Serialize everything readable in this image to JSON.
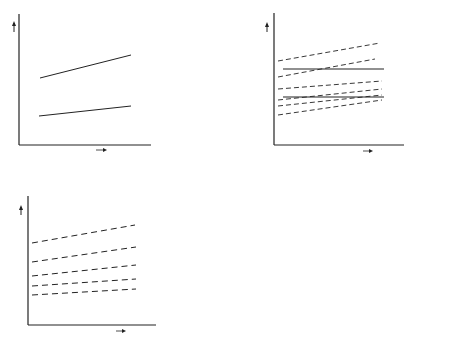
{
  "panels": {
    "a": {
      "caption": "a",
      "y_axis_label": "Z",
      "x_axis_label": "S",
      "lines": [
        {
          "label": "P",
          "subscript": "2",
          "style": "solid"
        },
        {
          "label": "P",
          "subscript": "1",
          "style": "solid"
        }
      ]
    },
    "b": {
      "caption": "b",
      "y_axis_label": "Z",
      "x_axis_label": "S",
      "dashed_label": "p",
      "solid_lines": [
        {
          "label": "Z",
          "subscript": "2"
        },
        {
          "label": "Z",
          "subscript": "1"
        }
      ]
    },
    "c": {
      "caption": "c",
      "y_axis_label": "Z",
      "x_axis_label": "S",
      "region_labels": {
        "warm": "Warm",
        "cold": "Cold"
      },
      "solid_lines": [
        {
          "label": "Z",
          "subscript": "2"
        },
        {
          "label": "Z",
          "subscript": "1"
        }
      ]
    },
    "d": {
      "caption": "d",
      "y_axis_label": "Z",
      "x_axis_label": "s",
      "point_a": "A",
      "point_b": "B",
      "interval_label": "δs",
      "level_label": "Z",
      "level_subscript": "s",
      "baseline_label": "Mean Sea Level",
      "baseline_value": "Z=O"
    }
  },
  "colors": {
    "ink": "#222222",
    "curve": "#555555",
    "background": "#ffffff"
  }
}
